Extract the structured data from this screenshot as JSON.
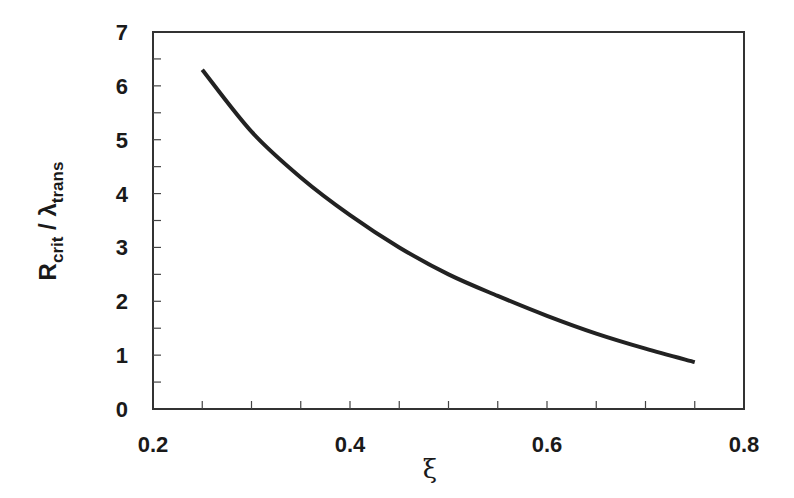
{
  "chart_data": {
    "type": "line",
    "title": "",
    "xlabel": "ξ",
    "ylabel": "R_crit / λ_trans",
    "ylabel_parts": {
      "main1": "R",
      "sub1": "crit",
      "sep": " / ",
      "main2": "λ",
      "sub2": "trans"
    },
    "xlim": [
      0.2,
      0.8
    ],
    "ylim": [
      0,
      7
    ],
    "xticks": [
      "0.2",
      "0.4",
      "0.6",
      "0.8"
    ],
    "yticks": [
      "0",
      "1",
      "2",
      "3",
      "4",
      "5",
      "6",
      "7"
    ],
    "x_minor_step": 0.05,
    "y_minor_step": 0.5,
    "grid": false,
    "legend": null,
    "series": [
      {
        "name": "R_crit / λ_trans",
        "color": "#222222",
        "x": [
          0.25,
          0.3,
          0.35,
          0.4,
          0.45,
          0.5,
          0.55,
          0.6,
          0.65,
          0.7,
          0.75
        ],
        "y": [
          6.3,
          5.15,
          4.3,
          3.6,
          3.0,
          2.5,
          2.1,
          1.73,
          1.4,
          1.12,
          0.87
        ]
      }
    ]
  }
}
